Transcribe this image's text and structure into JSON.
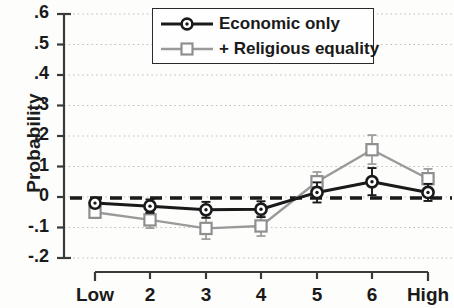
{
  "chart_data": {
    "type": "line",
    "title": "",
    "subtitle": "",
    "xlabel": "",
    "ylabel": "Probability",
    "categories": [
      "Low",
      "2",
      "3",
      "4",
      "5",
      "6",
      "High"
    ],
    "x_tick_labels": [
      "Low",
      "2",
      "3",
      "4",
      "5",
      "6",
      "High"
    ],
    "y_tick_labels": [
      ".6",
      ".5",
      ".4",
      ".3",
      ".2",
      ".1",
      "0",
      "-.1",
      "-.2"
    ],
    "y_tick_values": [
      0.6,
      0.5,
      0.4,
      0.3,
      0.2,
      0.1,
      0,
      -0.1,
      -0.2
    ],
    "ylim": [
      -0.2,
      0.6
    ],
    "grid": "horizontal-dotted",
    "legend_position": "top-center",
    "reference_line": {
      "value": 0,
      "style": "dashed",
      "color": "#1a1a1a"
    },
    "series": [
      {
        "name": "Economic only",
        "color": "#1a1a1a",
        "marker": "open-circle",
        "values": [
          -0.02,
          -0.03,
          -0.042,
          -0.04,
          0.015,
          0.05,
          0.015
        ],
        "err_low": [
          -0.035,
          -0.052,
          -0.068,
          -0.066,
          -0.018,
          0.006,
          -0.013
        ],
        "err_high": [
          -0.005,
          -0.008,
          -0.016,
          -0.014,
          0.048,
          0.095,
          0.043
        ]
      },
      {
        "name": "+ Religious equality",
        "color": "#9a9a9a",
        "marker": "open-square",
        "values": [
          -0.05,
          -0.075,
          -0.103,
          -0.095,
          0.05,
          0.155,
          0.06
        ],
        "err_low": [
          -0.068,
          -0.102,
          -0.138,
          -0.128,
          0.02,
          0.108,
          0.03
        ],
        "err_high": [
          -0.032,
          -0.048,
          -0.068,
          -0.062,
          0.082,
          0.203,
          0.092
        ]
      }
    ]
  },
  "legend": {
    "items": [
      {
        "label": "Economic only"
      },
      {
        "label": "+ Religious equality"
      }
    ]
  },
  "axes": {
    "y_title": "Probability"
  }
}
